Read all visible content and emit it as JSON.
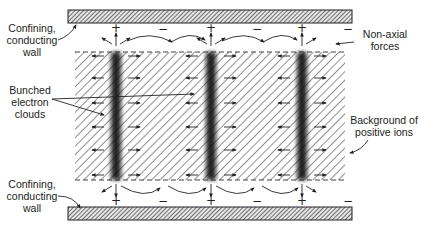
{
  "diagram": {
    "labels": {
      "top_wall": [
        "Confining,",
        "conducting",
        "wall"
      ],
      "bottom_wall": [
        "Confining,",
        "conducting",
        "wall"
      ],
      "non_axial": [
        "Non-axial",
        "forces"
      ],
      "electron_clouds": [
        "Bunched",
        "electron",
        "clouds"
      ],
      "positive_ions": [
        "Background of",
        "positive ions"
      ]
    },
    "top_signs": [
      {
        "x": 110,
        "text": "+"
      },
      {
        "x": 157,
        "text": "−"
      },
      {
        "x": 205,
        "text": "+"
      },
      {
        "x": 251,
        "text": "−"
      },
      {
        "x": 296,
        "text": "+"
      },
      {
        "x": 342,
        "text": "−"
      }
    ],
    "bottom_signs": [
      {
        "x": 110,
        "text": "+"
      },
      {
        "x": 157,
        "text": "−"
      },
      {
        "x": 205,
        "text": "+"
      },
      {
        "x": 251,
        "text": "−"
      },
      {
        "x": 296,
        "text": "+"
      },
      {
        "x": 342,
        "text": "−"
      }
    ],
    "electron_cloud_x": [
      116,
      211,
      302
    ],
    "colors": {
      "ink": "#222222",
      "hatch": "#555555",
      "wall_fill": "#888888",
      "background": "#ffffff"
    }
  }
}
